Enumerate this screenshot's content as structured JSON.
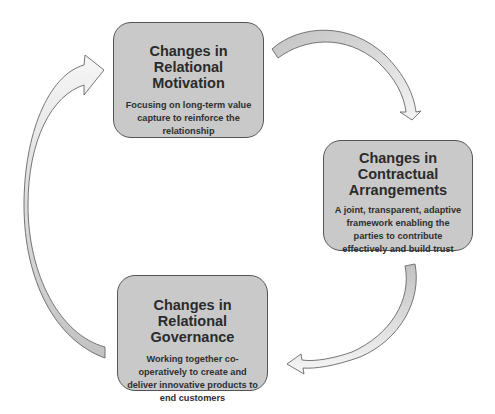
{
  "diagram": {
    "type": "cycle",
    "direction": "clockwise",
    "nodes": [
      {
        "id": "relational-motivation",
        "title": "Changes in Relational Motivation",
        "description": "Focusing on long-term value capture to reinforce the relationship"
      },
      {
        "id": "contractual-arrangements",
        "title": "Changes in Contractual Arrangements",
        "description": "A joint, transparent, adaptive framework enabling the parties to contribute effectively and build trust"
      },
      {
        "id": "relational-governance",
        "title": "Changes in Relational Governance",
        "description": "Working together co-operatively to create and deliver innovative products to end customers"
      }
    ],
    "edges": [
      {
        "from": "relational-motivation",
        "to": "contractual-arrangements"
      },
      {
        "from": "contractual-arrangements",
        "to": "relational-governance"
      },
      {
        "from": "relational-governance",
        "to": "relational-motivation"
      }
    ],
    "colors": {
      "box_fill": "#c9c9c9",
      "box_border": "#555555",
      "arrow_fill_dark": "#c6c6c6",
      "arrow_fill_light": "#f2f2f2",
      "arrow_stroke": "#666666",
      "text": "#2b2b2b"
    }
  }
}
